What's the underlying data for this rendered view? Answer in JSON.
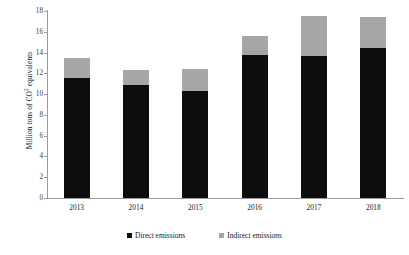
{
  "chart_data": {
    "type": "bar",
    "stacked": true,
    "title": "",
    "xlabel": "",
    "ylabel": "Million tons of CO² equivalents",
    "ylabel_main": "Million tons of CO",
    "ylabel_sup": "2",
    "ylabel_tail": " equivalents",
    "categories": [
      "2013",
      "2014",
      "2015",
      "2016",
      "2017",
      "2018"
    ],
    "series": [
      {
        "name": "Direct emissions",
        "color": "#0d0d0d",
        "values": [
          11.6,
          10.9,
          10.3,
          13.8,
          13.7,
          14.4
        ]
      },
      {
        "name": "Indirect emissions",
        "color": "#a6a6a6",
        "values": [
          1.9,
          1.4,
          2.1,
          1.8,
          3.8,
          3.0
        ]
      }
    ],
    "totals": [
      13.5,
      12.3,
      12.4,
      15.6,
      17.5,
      17.4
    ],
    "ylim": [
      0,
      18
    ],
    "yticks": [
      0,
      2,
      4,
      6,
      8,
      10,
      12,
      14,
      16,
      18
    ],
    "ytick_labels": [
      "0",
      "2",
      "4",
      "6",
      "8",
      "10",
      "12",
      "14",
      "16",
      "18"
    ],
    "grid": false,
    "legend_position": "bottom"
  },
  "legend": {
    "entries": [
      {
        "label": "Direct emissions"
      },
      {
        "label": "Indirect emissions"
      }
    ]
  }
}
